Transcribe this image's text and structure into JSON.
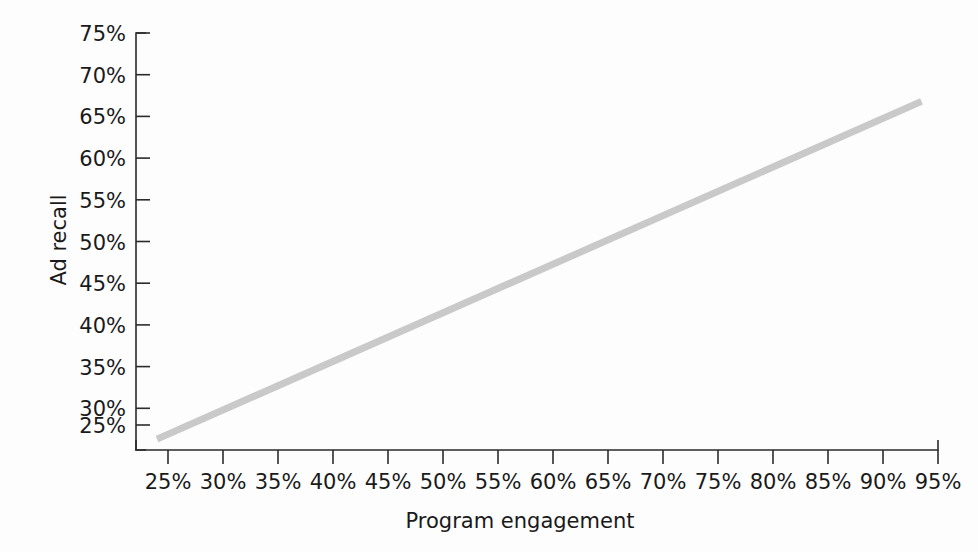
{
  "chart_data": {
    "type": "line",
    "title": "",
    "xlabel": "Program engagement",
    "ylabel": "Ad recall",
    "xlim": [
      23.0,
      96.5
    ],
    "ylim": [
      23.0,
      76.5
    ],
    "grid": false,
    "legend": "none",
    "xticks": [
      "25%",
      "30%",
      "35%",
      "40%",
      "45%",
      "50%",
      "55%",
      "60%",
      "65%",
      "70%",
      "75%",
      "80%",
      "85%",
      "90%",
      "95%"
    ],
    "xtick_values": [
      25,
      30,
      35,
      40,
      45,
      50,
      55,
      60,
      65,
      70,
      75,
      80,
      85,
      90,
      95
    ],
    "yticks": [
      "25%",
      "30%",
      "35%",
      "40%",
      "45%",
      "50%",
      "55%",
      "60%",
      "65%",
      "70%",
      "75%"
    ],
    "ytick_values": [
      25,
      30,
      35,
      40,
      45,
      50,
      55,
      60,
      65,
      70,
      75
    ],
    "series": [
      {
        "name": "trend",
        "color": "#c9c9c9",
        "width_px": 7,
        "x": [
          24.0,
          93.5
        ],
        "values": [
          26.3,
          66.8
        ]
      }
    ]
  },
  "axes": {
    "x_axis_name": "x-axis",
    "y_axis_name": "y-axis"
  }
}
